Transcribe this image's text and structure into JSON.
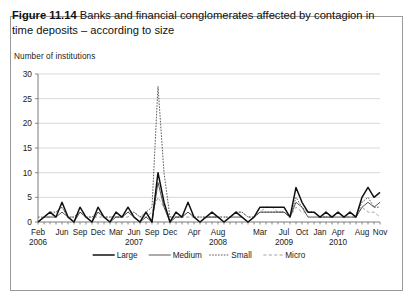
{
  "caption": {
    "figure_number": "Figure 11.14",
    "text": "Banks and financial conglomerates affected by contagion in time deposits – according to size"
  },
  "chart_data": {
    "type": "line",
    "title": "Banks and financial conglomerates affected by contagion in time deposits – according to size",
    "ylabel": "Number of institutions",
    "xlabel": "",
    "ylim": [
      0,
      30
    ],
    "yticks": [
      0,
      5,
      10,
      15,
      20,
      25,
      30
    ],
    "grid": true,
    "legend_position": "bottom",
    "xtick_labels": [
      "Feb",
      "Jun",
      "Sep",
      "Dec",
      "Mar",
      "Jun",
      "Sep",
      "Dec",
      "Apr",
      "Aug",
      "Mar",
      "Jul",
      "Oct",
      "Jan",
      "Apr",
      "Aug",
      "Nov"
    ],
    "xtick_indices": [
      0,
      4,
      7,
      10,
      13,
      16,
      19,
      22,
      26,
      30,
      37,
      41,
      44,
      47,
      50,
      54,
      57
    ],
    "year_labels": [
      "2006",
      "2007",
      "2008",
      "2009",
      "2010"
    ],
    "year_label_indices": [
      0,
      16,
      30,
      41,
      50
    ],
    "x": [
      "2006-02",
      "2006-03",
      "2006-04",
      "2006-05",
      "2006-06",
      "2006-07",
      "2006-08",
      "2006-09",
      "2006-10",
      "2006-11",
      "2006-12",
      "2007-01",
      "2007-02",
      "2007-03",
      "2007-04",
      "2007-05",
      "2007-06",
      "2007-07",
      "2007-08",
      "2007-09",
      "2007-10",
      "2007-11",
      "2007-12",
      "2008-01",
      "2008-02",
      "2008-03",
      "2008-04",
      "2008-05",
      "2008-06",
      "2008-07",
      "2008-08",
      "2008-09",
      "2008-10",
      "2008-11",
      "2008-12",
      "2009-01",
      "2009-02",
      "2009-03",
      "2009-04",
      "2009-05",
      "2009-06",
      "2009-07",
      "2009-08",
      "2009-09",
      "2009-10",
      "2009-11",
      "2009-12",
      "2010-01",
      "2010-02",
      "2010-03",
      "2010-04",
      "2010-05",
      "2010-06",
      "2010-07",
      "2010-08",
      "2010-09",
      "2010-10",
      "2010-11"
    ],
    "series": [
      {
        "name": "Large",
        "style": "solid-thick",
        "color": "#111111",
        "values": [
          0,
          1,
          2,
          1,
          4,
          1,
          0,
          3,
          1,
          0,
          3,
          1,
          0,
          2,
          1,
          3,
          1,
          0,
          2,
          0,
          10,
          4,
          0,
          2,
          1,
          4,
          1,
          0,
          1,
          2,
          1,
          0,
          1,
          2,
          1,
          0,
          1,
          3,
          3,
          3,
          3,
          3,
          1,
          7,
          4,
          2,
          2,
          1,
          2,
          1,
          2,
          1,
          2,
          1,
          5,
          7,
          5,
          6
        ]
      },
      {
        "name": "Medium",
        "style": "solid-thin",
        "color": "#3a3a3a",
        "values": [
          0,
          1,
          1,
          1,
          2,
          1,
          0,
          2,
          1,
          0,
          2,
          1,
          0,
          1,
          1,
          2,
          1,
          0,
          1,
          0,
          8,
          3,
          0,
          1,
          1,
          2,
          1,
          0,
          1,
          1,
          1,
          0,
          1,
          1,
          1,
          0,
          1,
          2,
          2,
          2,
          2,
          2,
          1,
          4,
          3,
          1,
          1,
          1,
          1,
          1,
          1,
          1,
          1,
          1,
          3,
          4,
          3,
          4
        ]
      },
      {
        "name": "Small",
        "style": "dotted",
        "color": "#4a4a4a",
        "values": [
          1,
          1,
          2,
          2,
          3,
          1,
          1,
          2,
          1,
          1,
          2,
          1,
          1,
          1,
          1,
          2,
          2,
          1,
          2,
          3,
          27.5,
          10,
          1,
          1,
          1,
          2,
          1,
          1,
          1,
          1,
          1,
          1,
          1,
          2,
          2,
          1,
          1,
          2,
          2,
          2,
          2,
          2,
          1,
          5,
          3,
          2,
          2,
          1,
          1,
          1,
          2,
          1,
          2,
          1,
          4,
          5,
          3,
          3
        ]
      },
      {
        "name": "Micro",
        "style": "dashed",
        "color": "#9a9a9a",
        "values": [
          0,
          1,
          1,
          2,
          3,
          1,
          1,
          2,
          1,
          1,
          1,
          1,
          1,
          1,
          1,
          1,
          2,
          1,
          1,
          2,
          5,
          3,
          1,
          1,
          1,
          1,
          1,
          1,
          1,
          1,
          1,
          1,
          1,
          2,
          2,
          1,
          1,
          2,
          3,
          3,
          2,
          2,
          1,
          3,
          2,
          2,
          2,
          1,
          1,
          1,
          2,
          1,
          1,
          1,
          3,
          2,
          2,
          1
        ]
      }
    ]
  },
  "legend": {
    "items": [
      {
        "label": "Large"
      },
      {
        "label": "Medium"
      },
      {
        "label": "Small"
      },
      {
        "label": "Micro"
      }
    ]
  }
}
